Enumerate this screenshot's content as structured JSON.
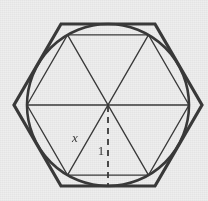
{
  "figure": {
    "background_color": "#eeeeee",
    "ink_color": "#3a3a3a",
    "labels": {
      "side_label": "x",
      "apothem_label": "1"
    },
    "geometry": {
      "center": {
        "x": 108,
        "y": 105
      },
      "circle_radius": 81,
      "circumscribed_hexagon_circumradius": 94,
      "circumscribed_hexagon_rotation_deg": 0,
      "inscribed_hexagon_circumradius": 81,
      "inscribed_hexagon_rotation_deg": 0,
      "diameter_count": 3,
      "apothem_line": {
        "from_y": 105,
        "to_y": 186,
        "dashed": true
      }
    },
    "stroke_widths": {
      "outer_hexagon": 3.2,
      "circle": 2.6,
      "inner_lines": 1.3,
      "dashed_line": 1.8
    }
  }
}
